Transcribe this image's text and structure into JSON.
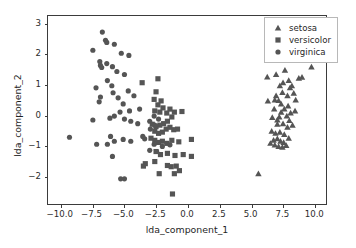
{
  "chart_data": {
    "type": "scatter",
    "title": "",
    "xlabel": "lda_component_1",
    "ylabel": "lda_component_2",
    "xlim": [
      -11.0,
      11.0
    ],
    "ylim": [
      -2.95,
      3.25
    ],
    "xticks": [
      -10.0,
      -7.5,
      -5.0,
      -2.5,
      0.0,
      2.5,
      5.0,
      7.5,
      10.0
    ],
    "xticklabels": [
      "−10.0",
      "−7.5",
      "−5.0",
      "−2.5",
      "0.0",
      "2.5",
      "5.0",
      "7.5",
      "10.0"
    ],
    "yticks": [
      -2,
      -1,
      0,
      1,
      2,
      3
    ],
    "yticklabels": [
      "−2",
      "−1",
      "0",
      "1",
      "2",
      "3"
    ],
    "grid": false,
    "legend_position": "upper right",
    "marker_color": "#555555",
    "series": [
      {
        "name": "setosa",
        "marker": "triangle",
        "color": "#555555",
        "points": [
          [
            6.35,
            1.24
          ],
          [
            7.05,
            1.32
          ],
          [
            7.75,
            1.46
          ],
          [
            9.1,
            1.23
          ],
          [
            9.85,
            1.57
          ],
          [
            6.4,
            0.45
          ],
          [
            6.95,
            0.48
          ],
          [
            7.25,
            0.46
          ],
          [
            7.55,
            0.73
          ],
          [
            7.95,
            0.62
          ],
          [
            8.15,
            0.88
          ],
          [
            8.45,
            0.7
          ],
          [
            8.6,
            0.48
          ],
          [
            8.0,
            0.28
          ],
          [
            7.7,
            0.18
          ],
          [
            7.45,
            0.08
          ],
          [
            7.3,
            -0.08
          ],
          [
            7.9,
            -0.05
          ],
          [
            8.2,
            0.05
          ],
          [
            7.15,
            -0.32
          ],
          [
            7.6,
            -0.3
          ],
          [
            7.95,
            -0.42
          ],
          [
            6.7,
            -0.55
          ],
          [
            7.0,
            -0.62
          ],
          [
            7.35,
            -0.58
          ],
          [
            7.7,
            -0.66
          ],
          [
            7.15,
            -0.8
          ],
          [
            6.85,
            -0.85
          ],
          [
            7.4,
            -0.88
          ],
          [
            7.65,
            -0.92
          ],
          [
            6.6,
            -0.95
          ],
          [
            6.95,
            -1.0
          ],
          [
            7.25,
            -1.05
          ],
          [
            7.55,
            -1.08
          ],
          [
            7.85,
            -1.02
          ],
          [
            8.05,
            -0.78
          ],
          [
            8.35,
            -0.35
          ],
          [
            8.55,
            0.12
          ],
          [
            7.05,
            0.62
          ],
          [
            7.35,
            0.95
          ],
          [
            7.6,
            1.05
          ],
          [
            8.05,
            1.12
          ],
          [
            8.3,
            0.95
          ],
          [
            7.15,
            -0.18
          ],
          [
            6.75,
            -0.1
          ],
          [
            5.65,
            -1.95
          ],
          [
            8.85,
            1.2
          ],
          [
            7.45,
            0.35
          ],
          [
            6.9,
            0.18
          ],
          [
            8.1,
            -0.2
          ]
        ]
      },
      {
        "name": "versicolor",
        "marker": "square",
        "color": "#555555",
        "points": [
          [
            -2.3,
            1.18
          ],
          [
            -3.55,
            1.05
          ],
          [
            -2.45,
            0.75
          ],
          [
            -2.6,
            0.5
          ],
          [
            -2.3,
            0.32
          ],
          [
            -2.55,
            0.12
          ],
          [
            -2.15,
            0.08
          ],
          [
            -1.9,
            0.22
          ],
          [
            -1.6,
            0.05
          ],
          [
            -1.35,
            0.18
          ],
          [
            -1.0,
            0.08
          ],
          [
            -0.4,
            0.1
          ],
          [
            -1.2,
            -0.08
          ],
          [
            -1.55,
            -0.22
          ],
          [
            -1.85,
            -0.3
          ],
          [
            -2.15,
            -0.35
          ],
          [
            -2.45,
            -0.4
          ],
          [
            -2.75,
            -0.32
          ],
          [
            -2.55,
            -0.55
          ],
          [
            -2.25,
            -0.62
          ],
          [
            -1.95,
            -0.58
          ],
          [
            -1.65,
            -0.48
          ],
          [
            -1.35,
            -0.42
          ],
          [
            -1.05,
            -0.5
          ],
          [
            -0.75,
            -0.48
          ],
          [
            -2.85,
            -0.78
          ],
          [
            -2.55,
            -0.85
          ],
          [
            -2.25,
            -0.92
          ],
          [
            -1.95,
            -0.88
          ],
          [
            -1.6,
            -0.95
          ],
          [
            -1.2,
            -0.85
          ],
          [
            -0.65,
            -0.9
          ],
          [
            0.35,
            -0.82
          ],
          [
            -2.45,
            -1.22
          ],
          [
            -2.1,
            -1.32
          ],
          [
            -1.55,
            -1.28
          ],
          [
            -0.95,
            -1.35
          ],
          [
            -0.3,
            -1.32
          ],
          [
            0.35,
            -1.38
          ],
          [
            -3.3,
            -1.62
          ],
          [
            -2.55,
            -1.55
          ],
          [
            -2.2,
            -1.95
          ],
          [
            -1.55,
            -1.68
          ],
          [
            -1.25,
            -1.72
          ],
          [
            -0.85,
            -1.7
          ],
          [
            -1.0,
            -1.95
          ],
          [
            -0.6,
            -1.85
          ],
          [
            -1.15,
            -2.62
          ],
          [
            -3.45,
            -1.7
          ],
          [
            -2.05,
            0.45
          ]
        ]
      },
      {
        "name": "virginica",
        "marker": "circle",
        "color": "#555555",
        "points": [
          [
            -6.7,
            2.72
          ],
          [
            -6.45,
            2.45
          ],
          [
            -6.35,
            2.38
          ],
          [
            -5.75,
            2.32
          ],
          [
            -7.45,
            2.12
          ],
          [
            -5.2,
            2.02
          ],
          [
            -4.6,
            1.95
          ],
          [
            -6.9,
            1.75
          ],
          [
            -6.85,
            1.62
          ],
          [
            -6.75,
            1.55
          ],
          [
            -6.35,
            1.68
          ],
          [
            -5.9,
            1.58
          ],
          [
            -5.55,
            1.42
          ],
          [
            -4.95,
            1.32
          ],
          [
            -7.2,
            0.88
          ],
          [
            -6.3,
            1.12
          ],
          [
            -5.95,
            0.95
          ],
          [
            -6.85,
            0.58
          ],
          [
            -6.95,
            0.42
          ],
          [
            -5.85,
            0.72
          ],
          [
            -5.45,
            0.55
          ],
          [
            -4.65,
            0.78
          ],
          [
            -4.2,
            0.62
          ],
          [
            -3.75,
            0.18
          ],
          [
            -5.05,
            0.35
          ],
          [
            -4.55,
            0.12
          ],
          [
            -5.3,
            0.08
          ],
          [
            -5.75,
            -0.05
          ],
          [
            -6.1,
            -0.12
          ],
          [
            -4.95,
            -0.15
          ],
          [
            -4.45,
            -0.22
          ],
          [
            -3.9,
            -0.3
          ],
          [
            -2.95,
            -0.22
          ],
          [
            -2.6,
            -0.05
          ],
          [
            -2.25,
            -0.15
          ],
          [
            -2.55,
            -0.35
          ],
          [
            -2.9,
            -0.48
          ],
          [
            -7.45,
            -0.18
          ],
          [
            -6.05,
            -0.72
          ],
          [
            -5.75,
            -0.88
          ],
          [
            -5.05,
            -0.82
          ],
          [
            -4.45,
            -0.88
          ],
          [
            -3.35,
            -0.8
          ],
          [
            -2.6,
            -0.98
          ],
          [
            -9.3,
            -0.75
          ],
          [
            -7.15,
            -0.98
          ],
          [
            -6.3,
            -0.98
          ],
          [
            -5.9,
            -1.38
          ],
          [
            -5.25,
            -2.12
          ],
          [
            -4.95,
            -2.12
          ],
          [
            -3.5,
            -0.72
          ],
          [
            -2.95,
            -1.18
          ],
          [
            -2.4,
            -1.22
          ],
          [
            -1.95,
            -1.05
          ],
          [
            -1.35,
            -1.0
          ]
        ]
      }
    ]
  },
  "legend": {
    "entries": [
      {
        "label": "setosa",
        "marker": "triangle"
      },
      {
        "label": "versicolor",
        "marker": "square"
      },
      {
        "label": "virginica",
        "marker": "circle"
      }
    ]
  }
}
